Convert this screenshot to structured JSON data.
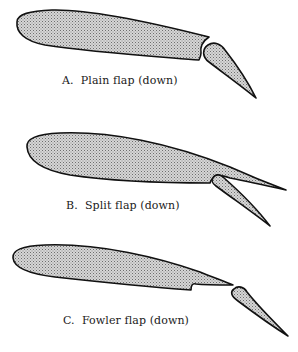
{
  "figure": {
    "fill_pattern": "stipple",
    "colors": {
      "outline": "#111111",
      "fill_dot": "#6e6e6e",
      "background": "#ffffff",
      "text": "#1a1a1a"
    },
    "panels": [
      {
        "id": "A",
        "letter": "A.",
        "label": "Plain flap (down)",
        "caption": "A.  Plain flap (down)"
      },
      {
        "id": "B",
        "letter": "B.",
        "label": "Split flap (down)",
        "caption": "B.  Split flap (down)"
      },
      {
        "id": "C",
        "letter": "C.",
        "label": "Fowler flap (down)",
        "caption": "C.  Fowler flap (down)"
      }
    ]
  }
}
